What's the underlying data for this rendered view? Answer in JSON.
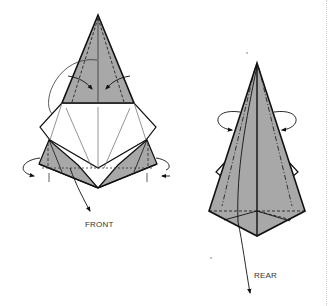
{
  "diagram": {
    "type": "origami-folding-instructions",
    "colors": {
      "paper_gray": "#a8a8a8",
      "line": "#111111",
      "thin_line": "#555555",
      "background": "#ffffff"
    },
    "figures": [
      {
        "id": "front-figure",
        "label": "FRONT",
        "description": "Cone shape with gray top triangle, white middle panel with radiating crease lines, and gray side flaps; arrows show inner-reverse folds at top and wrap-around folds at sides"
      },
      {
        "id": "rear-figure",
        "label": "REAR",
        "description": "Tall gray pyramid with dash-dot crease lines, white side flaps, pentagonal base; looping arrows on both sides indicate folding behind"
      }
    ]
  }
}
